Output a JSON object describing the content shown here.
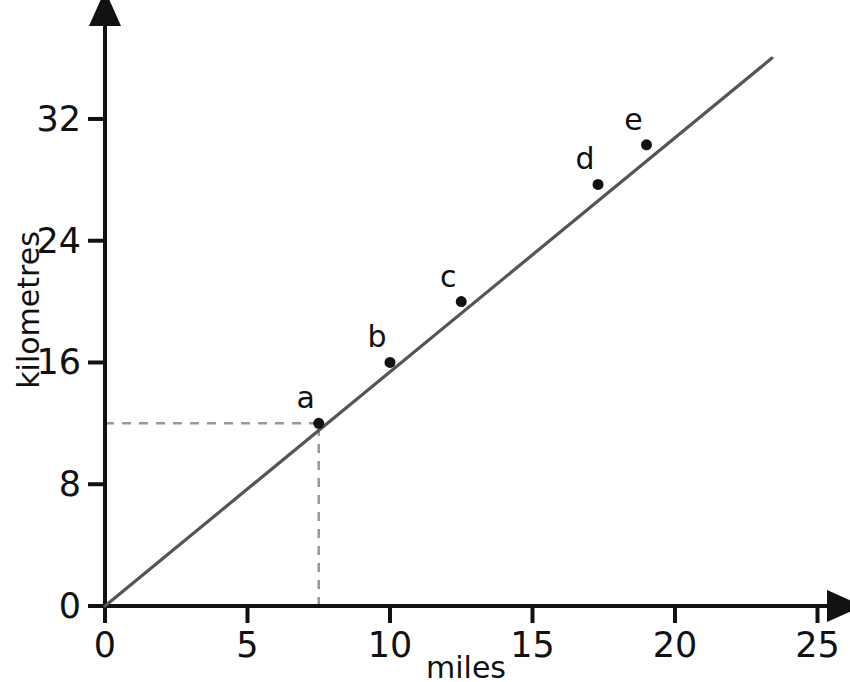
{
  "chart_data": {
    "type": "line",
    "title": "",
    "subtitle": "",
    "xlabel": "miles",
    "ylabel": "kilometres",
    "xlim": [
      0,
      25
    ],
    "ylim": [
      0,
      36
    ],
    "grid": false,
    "legend": null,
    "x_ticks": [
      "0",
      "5",
      "10",
      "15",
      "20",
      "25"
    ],
    "x_tick_values": [
      0,
      5,
      10,
      15,
      20,
      25
    ],
    "y_ticks": [
      "0",
      "8",
      "16",
      "24",
      "32"
    ],
    "y_tick_values": [
      0,
      8,
      16,
      24,
      32
    ],
    "origin_label": "0",
    "line": {
      "name": "miles to kilometres conversion",
      "color": "#555555",
      "x_start": 0,
      "y_start": 0,
      "x_end": 23.4,
      "y_end": 36.0,
      "slope_km_per_mile": 1.6
    },
    "points": [
      {
        "label": "a",
        "x": 7.5,
        "y": 12.0
      },
      {
        "label": "b",
        "x": 10.0,
        "y": 16.0
      },
      {
        "label": "c",
        "x": 12.5,
        "y": 20.0
      },
      {
        "label": "d",
        "x": 17.3,
        "y": 27.7
      },
      {
        "label": "e",
        "x": 19.0,
        "y": 30.3
      }
    ],
    "guide_lines": [
      {
        "name": "horizontal-guide-a",
        "from_x": 0,
        "from_y": 12.0,
        "to_x": 7.5,
        "to_y": 12.0,
        "style": "dashed",
        "color": "#999999"
      },
      {
        "name": "vertical-guide-a",
        "from_x": 7.5,
        "from_y": 0,
        "to_x": 7.5,
        "to_y": 12.0,
        "style": "dashed",
        "color": "#999999"
      }
    ],
    "axis_color": "#111111",
    "point_color": "#111111",
    "background": "#ffffff"
  },
  "geometry": {
    "origin_px": {
      "x": 105,
      "y": 606
    },
    "x_px_per_unit": 28.5,
    "y_px_per_unit": 15.22,
    "x_axis_arrow_end_px": 845,
    "y_axis_arrow_end_px": 8
  }
}
